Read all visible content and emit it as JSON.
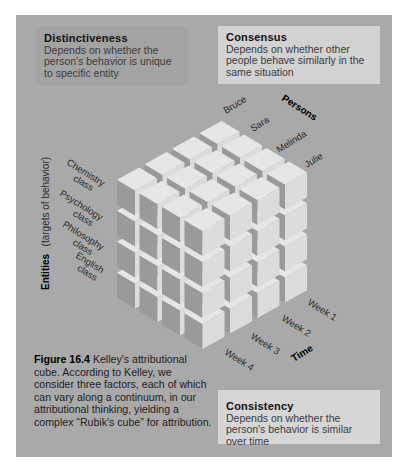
{
  "boxes": {
    "distinctiveness": {
      "title": "Distinctiveness",
      "text": "Depends on whether the person's behavior is unique to specific entity"
    },
    "consensus": {
      "title": "Consensus",
      "text": "Depends on whether other people behave similarly in the same situation"
    },
    "consistency": {
      "title": "Consistency",
      "text": "Depends on whether the person's behavior is similar over time"
    }
  },
  "axes": {
    "persons": {
      "title": "Persons",
      "labels": [
        "Bruce",
        "Sara",
        "Melinda",
        "Julie"
      ]
    },
    "entities": {
      "title": "Entities",
      "subtitle": "(targets of behavior)",
      "labels": [
        [
          "Chemistry",
          "class"
        ],
        [
          "Psychology",
          "class"
        ],
        [
          "Philosophy",
          "class"
        ],
        [
          "English",
          "class"
        ]
      ]
    },
    "time": {
      "title": "Time",
      "labels": [
        "Week 1",
        "Week 2",
        "Week 3",
        "Week 4"
      ]
    }
  },
  "caption": {
    "figure": "Figure 16.4",
    "text": " Kelley's attributional cube. According to Kelley, we consider three factors, each of which can vary along a continuum, in our attributional thinking, yielding a complex “Rubik's cube” for attribution."
  },
  "colors": {
    "panel": "#a9a9a9",
    "cube_top": "#e6e6e6",
    "cube_left": "#9a9a9a",
    "cube_right": "#dcdcdc",
    "box_distinct": "#a3a3a3",
    "box_light": "#d4d4d4"
  },
  "grid": {
    "persons": 4,
    "time": 4,
    "entities": 4
  }
}
